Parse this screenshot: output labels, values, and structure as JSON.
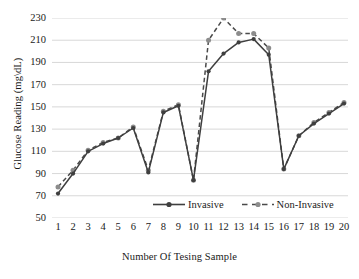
{
  "chart_data": {
    "type": "line",
    "title": "",
    "xlabel": "Number Of Tesing Sample",
    "ylabel": "Glucose Reading (mg\\dL)",
    "categories": [
      1,
      2,
      3,
      4,
      5,
      6,
      7,
      8,
      9,
      10,
      11,
      12,
      13,
      14,
      15,
      16,
      17,
      18,
      19,
      20
    ],
    "xtick_labels": [
      "1",
      "2",
      "3",
      "4",
      "5",
      "6",
      "7",
      "8",
      "9",
      "10",
      "11",
      "12",
      "13",
      "14",
      "15",
      "16",
      "17",
      "18",
      "19",
      "20"
    ],
    "ytick_labels": [
      "230",
      "210",
      "190",
      "170",
      "150",
      "130",
      "110",
      "90",
      "70",
      "50"
    ],
    "yticks": [
      230,
      210,
      190,
      170,
      150,
      130,
      110,
      90,
      70,
      50
    ],
    "ylim": [
      50,
      230
    ],
    "xlim": [
      1,
      20
    ],
    "grid": "horizontal",
    "legend_position": "inside-bottom-center",
    "series": [
      {
        "name": "Invasive",
        "line_style": "solid",
        "color": "#3f3f3f",
        "marker": "circle",
        "values": [
          72,
          90,
          110,
          117,
          122,
          131,
          91,
          145,
          151,
          84,
          182,
          198,
          208,
          211,
          197,
          94,
          124,
          135,
          144,
          153
        ]
      },
      {
        "name": "Non-Invasive",
        "line_style": "dashed",
        "color": "#4a4a4a",
        "marker": "circle",
        "marker_color": "#8c8c8c",
        "values": [
          78,
          93,
          111,
          118,
          122,
          132,
          93,
          146,
          152,
          84,
          210,
          230,
          216,
          216,
          203,
          94,
          124,
          136,
          145,
          154
        ]
      }
    ]
  },
  "legend": {
    "items": [
      {
        "label": "Invasive"
      },
      {
        "label": "Non-Invasive"
      }
    ]
  },
  "colors": {
    "gridline": "#d4d4d4",
    "invasive": "#3f3f3f",
    "non_invasive": "#4a4a4a",
    "marker_fill": "#8c8c8c",
    "background": "#ffffff",
    "text": "#1a1a1a"
  }
}
